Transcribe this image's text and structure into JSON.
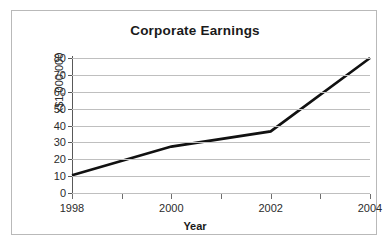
{
  "chart_data": {
    "type": "line",
    "title": "Corporate Earnings",
    "xlabel": "Year",
    "ylabel": "x$1,000,000",
    "x": [
      1998,
      2000,
      2002,
      2004
    ],
    "categories": [
      "1998",
      "2000",
      "2002",
      "2004"
    ],
    "series": [
      {
        "name": "Corporate Earnings",
        "values": [
          10.5,
          27.5,
          36.5,
          80
        ]
      }
    ],
    "xlim": [
      1998,
      2004
    ],
    "ylim": [
      0,
      80
    ],
    "y_ticks": [
      0,
      10,
      20,
      30,
      40,
      50,
      60,
      70,
      80
    ],
    "y_tick_labels": [
      "0",
      "10",
      "20",
      "30",
      "40",
      "50",
      "60",
      "70",
      "80"
    ],
    "x_ticks": [
      1998,
      1999,
      2000,
      2001,
      2002,
      2003,
      2004
    ],
    "x_tick_labels": [
      "1998",
      "",
      "2000",
      "",
      "2002",
      "",
      "2004"
    ],
    "x_major_ticks": [
      1998,
      2000,
      2002,
      2004
    ],
    "grid": "horizontal",
    "legend": "none",
    "colors": {
      "line": "#111111",
      "grid": "#bfbfbf",
      "axis": "#595959",
      "text": "#2b2b2b",
      "border": "#b9b9b9",
      "background": "#ffffff"
    }
  }
}
